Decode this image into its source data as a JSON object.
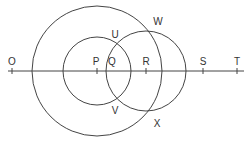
{
  "diagram": {
    "line": {
      "y": 71,
      "x1": 8,
      "x2": 244
    },
    "points": [
      {
        "id": "O",
        "label": "O",
        "x": 12,
        "tick": true,
        "label_x": 12,
        "label_y": 57
      },
      {
        "id": "P",
        "label": "P",
        "x": 97,
        "tick": true,
        "label_x": 96,
        "label_y": 57
      },
      {
        "id": "Q",
        "label": "Q",
        "x": 111,
        "tick": false,
        "label_x": 112,
        "label_y": 57
      },
      {
        "id": "R",
        "label": "R",
        "x": 146,
        "tick": true,
        "label_x": 146,
        "label_y": 57
      },
      {
        "id": "S",
        "label": "S",
        "x": 203,
        "tick": true,
        "label_x": 203,
        "label_y": 57
      },
      {
        "id": "T",
        "label": "T",
        "x": 237,
        "tick": true,
        "label_x": 237,
        "label_y": 57
      }
    ],
    "intersections": [
      {
        "label": "U",
        "label_x": 115,
        "label_y": 30
      },
      {
        "label": "V",
        "label_x": 115,
        "label_y": 106
      },
      {
        "label": "W",
        "label_x": 158,
        "label_y": 17
      },
      {
        "label": "X",
        "label_x": 157,
        "label_y": 119
      }
    ],
    "circles": [
      {
        "name": "large-circle-centered-P",
        "cx": 97,
        "cy": 71,
        "r": 65
      },
      {
        "name": "small-circle-centered-P",
        "cx": 97,
        "cy": 71,
        "r": 34
      },
      {
        "name": "circle-centered-R",
        "cx": 146,
        "cy": 71,
        "r": 40
      }
    ],
    "stroke_color": "#444444"
  }
}
